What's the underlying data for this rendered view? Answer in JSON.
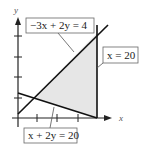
{
  "diagram": {
    "type": "linear-programming-feasible-region",
    "axes": {
      "x_label": "x",
      "y_label": "y"
    },
    "constraints": [
      {
        "id": "c1",
        "equation": "−3x + 2y = 4"
      },
      {
        "id": "c2",
        "equation": "x = 20"
      },
      {
        "id": "c3",
        "equation": "x + 2y = 20"
      }
    ],
    "colors": {
      "region_fill": "#e6e6e6",
      "line": "#111111",
      "axis": "#222222",
      "label_border": "#666666"
    }
  }
}
